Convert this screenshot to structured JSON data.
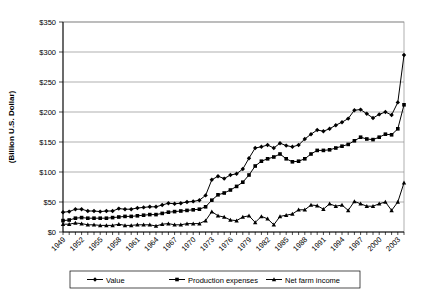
{
  "chart_data": {
    "type": "line",
    "title": "",
    "xlabel": "",
    "ylabel": "(Billion U.S. Dollar)",
    "ylim": [
      0,
      350
    ],
    "ytick_labels": [
      "$0",
      "$50",
      "$100",
      "$150",
      "$200",
      "$250",
      "$300",
      "$350"
    ],
    "ytick_values": [
      0,
      50,
      100,
      150,
      200,
      250,
      300,
      350
    ],
    "grid": true,
    "legend_position": "bottom",
    "xtick_labels": [
      "1949",
      "1952",
      "1955",
      "1958",
      "1961",
      "1964",
      "1967",
      "1970",
      "1973",
      "1976",
      "1979",
      "1982",
      "1985",
      "1988",
      "1991",
      "1994",
      "1997",
      "2000",
      "2003"
    ],
    "x": [
      1949,
      1950,
      1951,
      1952,
      1953,
      1954,
      1955,
      1956,
      1957,
      1958,
      1959,
      1960,
      1961,
      1962,
      1963,
      1964,
      1965,
      1966,
      1967,
      1968,
      1969,
      1970,
      1971,
      1972,
      1973,
      1974,
      1975,
      1976,
      1977,
      1978,
      1979,
      1980,
      1981,
      1982,
      1983,
      1984,
      1985,
      1986,
      1987,
      1988,
      1989,
      1990,
      1991,
      1992,
      1993,
      1994,
      1995,
      1996,
      1997,
      1998,
      1999,
      2000,
      2001,
      2002,
      2003,
      2004
    ],
    "series": [
      {
        "name": "Value",
        "marker": "diamond",
        "values": [
          33,
          34,
          38,
          38,
          35,
          35,
          34,
          35,
          35,
          39,
          38,
          38,
          40,
          41,
          42,
          42,
          45,
          48,
          47,
          48,
          50,
          51,
          53,
          61,
          87,
          93,
          89,
          95,
          97,
          105,
          123,
          140,
          142,
          145,
          140,
          148,
          144,
          142,
          145,
          155,
          163,
          170,
          168,
          172,
          178,
          183,
          189,
          203,
          204,
          197,
          190,
          196,
          200,
          195,
          216,
          295
        ]
      },
      {
        "name": "Production expenses",
        "marker": "square",
        "values": [
          19,
          20,
          23,
          24,
          23,
          23,
          23,
          23,
          24,
          25,
          26,
          26,
          27,
          28,
          29,
          29,
          31,
          33,
          34,
          35,
          36,
          37,
          38,
          42,
          53,
          62,
          65,
          70,
          76,
          83,
          95,
          110,
          118,
          122,
          125,
          130,
          122,
          117,
          118,
          122,
          130,
          136,
          136,
          137,
          140,
          143,
          146,
          152,
          158,
          155,
          154,
          158,
          163,
          162,
          172,
          212
        ]
      },
      {
        "name": "Net farm income",
        "marker": "triangle",
        "values": [
          13,
          13,
          15,
          14,
          12,
          12,
          11,
          11,
          11,
          13,
          11,
          11,
          12,
          12,
          12,
          10,
          13,
          14,
          12,
          12,
          14,
          14,
          14,
          19,
          34,
          27,
          25,
          20,
          19,
          25,
          27,
          16,
          26,
          22,
          12,
          26,
          28,
          30,
          37,
          37,
          45,
          44,
          38,
          47,
          43,
          45,
          36,
          51,
          47,
          43,
          43,
          47,
          50,
          36,
          50,
          82
        ]
      }
    ]
  },
  "legend": {
    "items": [
      {
        "label": "Value"
      },
      {
        "label": "Production expenses"
      },
      {
        "label": "Net farm income"
      }
    ]
  }
}
